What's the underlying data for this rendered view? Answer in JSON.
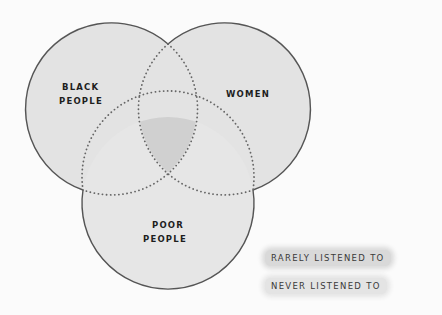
{
  "diagram": {
    "type": "venn",
    "circles": [
      {
        "label_lines": [
          "BLACK",
          "PEOPLE"
        ],
        "cx": 111,
        "cy": 108,
        "r": 86
      },
      {
        "label_lines": [
          "WOMEN"
        ],
        "cx": 225,
        "cy": 108,
        "r": 86
      },
      {
        "label_lines": [
          "POOR",
          "PEOPLE"
        ],
        "cx": 168,
        "cy": 203,
        "r": 86
      }
    ],
    "colors": {
      "rarely": "#e3e3e3",
      "never": "#cfcfcf",
      "outline": "#555555",
      "dots": "#666666"
    }
  },
  "labels": {
    "black_line1": "BLACK",
    "black_line2": "PEOPLE",
    "women": "WOMEN",
    "poor_line1": "POOR",
    "poor_line2": "PEOPLE"
  },
  "legend": {
    "rarely": "RARELY LISTENED TO",
    "never": "NEVER LISTENED TO"
  }
}
